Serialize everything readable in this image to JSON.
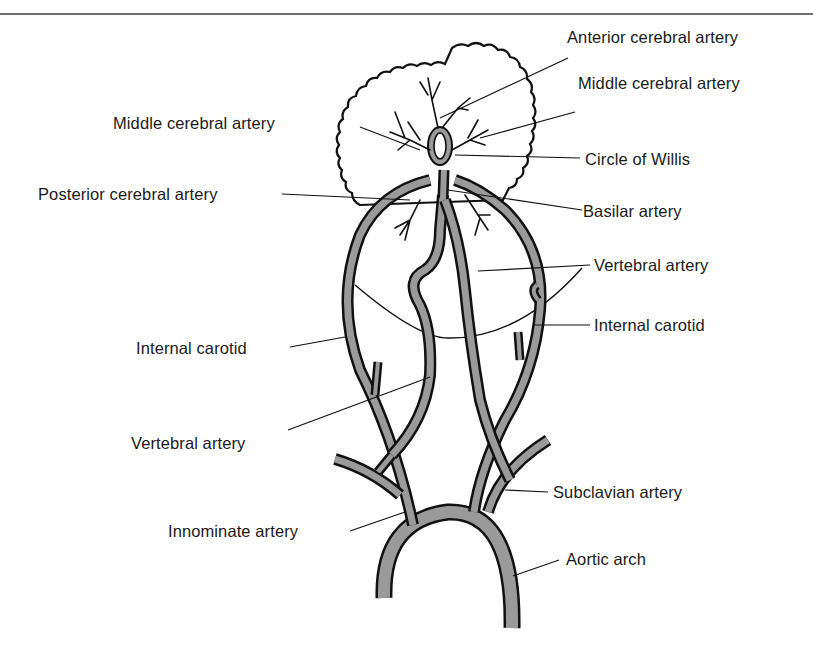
{
  "figure": {
    "colors": {
      "vessel_fill": "#9a9a9a",
      "outline": "#111111",
      "background": "#ffffff",
      "rule": "#6e6e6e"
    }
  },
  "labels": {
    "anterior_cerebral_artery": "Anterior cerebral artery",
    "middle_cerebral_artery_right": "Middle cerebral artery",
    "middle_cerebral_artery_left": "Middle cerebral artery",
    "circle_of_willis": "Circle of Willis",
    "posterior_cerebral_artery": "Posterior cerebral artery",
    "basilar_artery": "Basilar artery",
    "vertebral_artery_right": "Vertebral artery",
    "internal_carotid_right": "Internal carotid",
    "internal_carotid_left": "Internal carotid",
    "vertebral_artery_left": "Vertebral artery",
    "subclavian_artery": "Subclavian artery",
    "innominate_artery": "Innominate artery",
    "aortic_arch": "Aortic arch"
  }
}
